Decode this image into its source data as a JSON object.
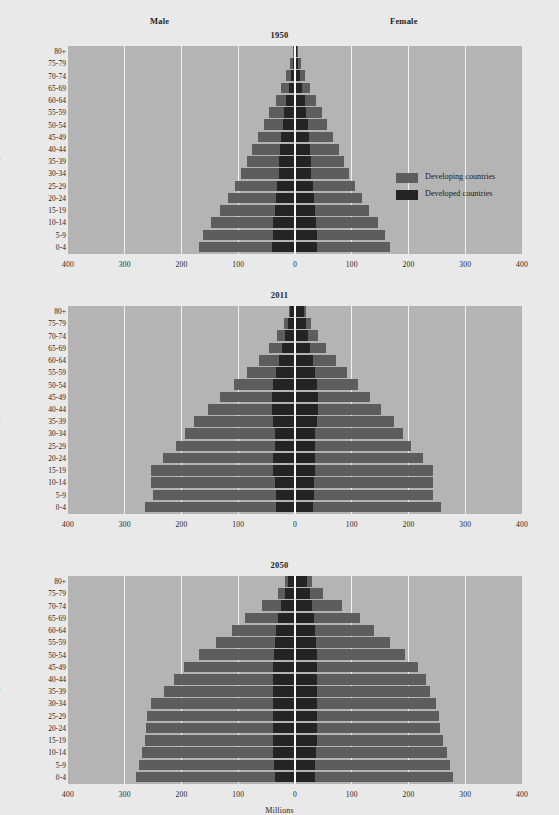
{
  "figure": {
    "background_color": "#e9e9e9",
    "plot_background_color": "#b4b4b4",
    "gridline_color": "#f2f2f2"
  },
  "headers": {
    "male": "Male",
    "female": "Female"
  },
  "legend": {
    "position": "inside-top-right-panel-1",
    "items": [
      {
        "label": "Developing countries",
        "color": "#5d5d5d",
        "key": "developing"
      },
      {
        "label": "Developed countries",
        "color": "#242424",
        "key": "developed"
      }
    ]
  },
  "axes": {
    "y_title": "Age (years)",
    "x_title": "Millions",
    "x_ticks": [
      "400",
      "300",
      "200",
      "100",
      "0",
      "100",
      "200",
      "300",
      "400"
    ],
    "x_tick_values": [
      -400,
      -300,
      -200,
      -100,
      0,
      100,
      200,
      300,
      400
    ],
    "xlim": [
      -400,
      400
    ],
    "age_groups": [
      "80+",
      "75-79",
      "70-74",
      "65-69",
      "60-64",
      "55-59",
      "50-54",
      "45-49",
      "40-44",
      "35-39",
      "30-34",
      "25-29",
      "20-24",
      "15-19",
      "10-14",
      "5-9",
      "0-4"
    ]
  },
  "chart_data": {
    "type": "bar",
    "chart_subtype": "population-pyramid",
    "xlabel": "Millions",
    "ylabel": "Age (years)",
    "xlim": [
      -400,
      400
    ],
    "grid": true,
    "legend_position": "panel-1 right",
    "categories": [
      "80+",
      "75-79",
      "70-74",
      "65-69",
      "60-64",
      "55-59",
      "50-54",
      "45-49",
      "40-44",
      "35-39",
      "30-34",
      "25-29",
      "20-24",
      "15-19",
      "10-14",
      "5-9",
      "0-4"
    ],
    "panels": [
      {
        "title": "1950",
        "series": [
          {
            "name": "Developed countries",
            "side": "male",
            "values": [
              2,
              4,
              7,
              11,
              15,
              19,
              22,
              25,
              27,
              28,
              29,
              31,
              33,
              36,
              38,
              39,
              40
            ]
          },
          {
            "name": "Developing countries",
            "side": "male",
            "values": [
              2,
              4,
              8,
              13,
              19,
              26,
              33,
              41,
              49,
              57,
              66,
              75,
              85,
              97,
              110,
              123,
              130
            ]
          },
          {
            "name": "Developed countries",
            "side": "female",
            "values": [
              3,
              6,
              9,
              13,
              17,
              20,
              23,
              25,
              27,
              28,
              29,
              31,
              33,
              35,
              37,
              38,
              39
            ]
          },
          {
            "name": "Developing countries",
            "side": "female",
            "values": [
              3,
              5,
              9,
              14,
              20,
              27,
              34,
              42,
              50,
              58,
              66,
              75,
              85,
              96,
              109,
              121,
              128
            ]
          }
        ]
      },
      {
        "title": "2011",
        "series": [
          {
            "name": "Developed countries",
            "side": "male",
            "values": [
              8,
              13,
              18,
              23,
              29,
              34,
              38,
              40,
              40,
              38,
              36,
              36,
              38,
              38,
              36,
              34,
              33
            ]
          },
          {
            "name": "Developing countries",
            "side": "male",
            "values": [
              3,
              6,
              13,
              22,
              35,
              50,
              70,
              92,
              113,
              140,
              158,
              173,
              195,
              215,
              217,
              217,
              232
            ]
          },
          {
            "name": "Developed countries",
            "side": "female",
            "values": [
              15,
              20,
              23,
              27,
              32,
              36,
              39,
              40,
              40,
              38,
              36,
              35,
              36,
              36,
              34,
              33,
              32
            ]
          },
          {
            "name": "Developing countries",
            "side": "female",
            "values": [
              5,
              9,
              17,
              27,
              40,
              55,
              72,
              92,
              112,
              137,
              155,
              170,
              190,
              208,
              210,
              210,
              225
            ]
          }
        ]
      },
      {
        "title": "2050",
        "series": [
          {
            "name": "Developed countries",
            "side": "male",
            "values": [
              12,
              18,
              25,
              30,
              33,
              36,
              37,
              38,
              38,
              38,
              38,
              38,
              38,
              38,
              38,
              37,
              36
            ]
          },
          {
            "name": "Developing countries",
            "side": "male",
            "values": [
              5,
              12,
              33,
              58,
              78,
              104,
              132,
              157,
              175,
              192,
              215,
              222,
              224,
              226,
              232,
              238,
              244
            ]
          },
          {
            "name": "Developed countries",
            "side": "female",
            "values": [
              22,
              27,
              30,
              33,
              35,
              37,
              38,
              38,
              38,
              38,
              38,
              38,
              38,
              38,
              37,
              36,
              35
            ]
          },
          {
            "name": "Developing countries",
            "side": "female",
            "values": [
              8,
              22,
              52,
              82,
              105,
              130,
              155,
              178,
              192,
              200,
              210,
              215,
              218,
              222,
              230,
              238,
              243
            ]
          }
        ]
      }
    ]
  }
}
